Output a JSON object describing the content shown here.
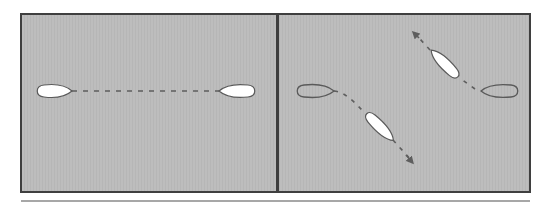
{
  "figure": {
    "background": "#ffffff",
    "panel_fill": "#bcbcbc",
    "panel_border": "#3f3f3f",
    "bottom_rule": "#8a8a8a",
    "dash_color": "#5e5e5e",
    "foil_outline": "#5a5a5a",
    "foil_white": "#ffffff",
    "panels": [
      {
        "id": "left",
        "label": "",
        "foils": [
          {
            "name": "left-foil",
            "fill": "white",
            "tip": "right"
          },
          {
            "name": "right-foil",
            "fill": "white",
            "tip": "left"
          }
        ],
        "path": "horizontal dashed line connecting foils"
      },
      {
        "id": "right",
        "label": "",
        "foils": [
          {
            "name": "left-outline-foil",
            "fill": "outline",
            "tip": "right"
          },
          {
            "name": "lower-white-foil",
            "fill": "white",
            "orientation": "diagonal"
          },
          {
            "name": "upper-white-foil",
            "fill": "white",
            "orientation": "diagonal"
          },
          {
            "name": "right-outline-foil",
            "fill": "outline",
            "tip": "left"
          }
        ],
        "paths": [
          "curved dashed arrow down-right",
          "dashed arrow up-left"
        ]
      }
    ]
  }
}
